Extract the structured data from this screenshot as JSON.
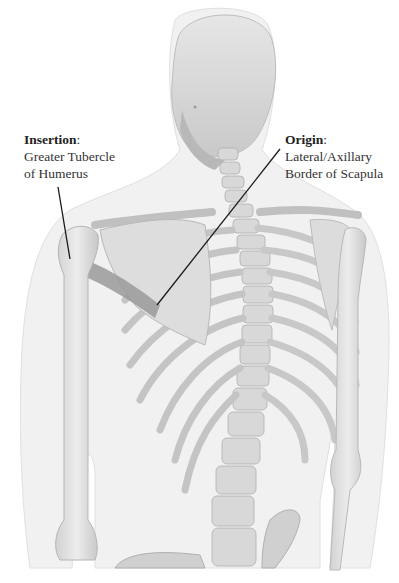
{
  "figure": {
    "colors": {
      "background": "#ffffff",
      "body_outline": "#e9e9e9",
      "bone_light": "#e4e4e4",
      "bone_mid": "#cfcfcf",
      "bone_dark": "#a8a8a8",
      "muscle_band": "#9a9a9a",
      "leader_line": "#1a1a1a",
      "text": "#333333"
    }
  },
  "labels": {
    "insertion": {
      "title": "Insertion",
      "colon": ":",
      "lines": [
        "Greater Tubercle",
        "of Humerus"
      ]
    },
    "origin": {
      "title": "Origin",
      "colon": ":",
      "lines": [
        "Lateral/Axillary",
        "Border of Scapula"
      ]
    }
  },
  "leader_lines": {
    "insertion": {
      "x1": 58,
      "y1": 187,
      "x2": 70,
      "y2": 259
    },
    "origin": {
      "x1": 280,
      "y1": 149,
      "x2": 157,
      "y2": 305
    }
  }
}
